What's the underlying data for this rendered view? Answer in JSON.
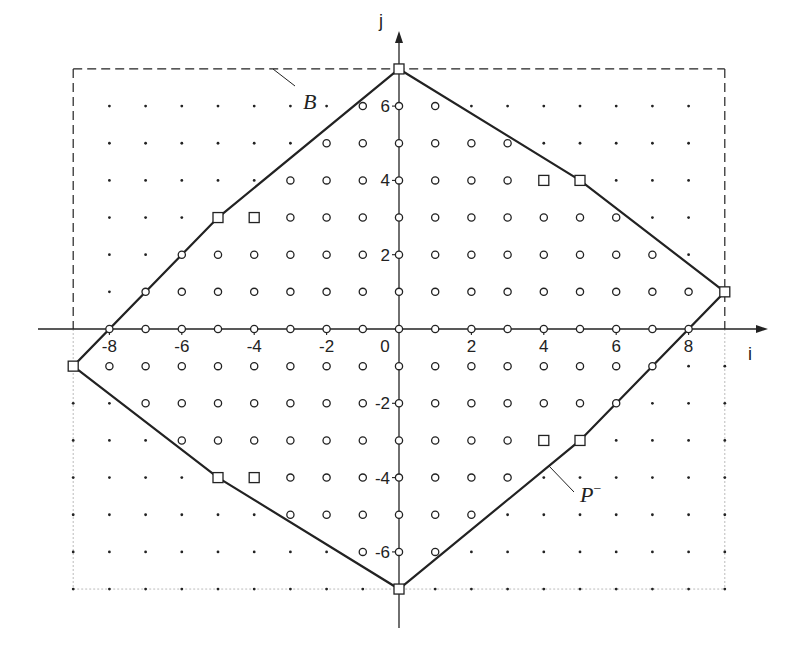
{
  "figure": {
    "axes": {
      "i_label": "i",
      "j_label": "j",
      "i_ticks": [
        -8,
        -6,
        -4,
        -2,
        0,
        2,
        4,
        6,
        8
      ],
      "i_tick_labels": [
        "-8",
        "-6",
        "-4",
        "-2",
        "0",
        "2",
        "4",
        "6",
        "8"
      ],
      "j_ticks": [
        -6,
        -4,
        -2,
        2,
        4,
        6
      ],
      "j_tick_labels": [
        "-6",
        "-4",
        "-2",
        "2",
        "4",
        "6"
      ]
    },
    "labels": {
      "bounding_box": "B",
      "polygon": "P",
      "polygon_superscript": "−"
    },
    "colors": {
      "ink": "#222222",
      "dotted_border": "#bbbbbb",
      "background": "#ffffff"
    }
  },
  "chart_data": {
    "type": "scatter",
    "title": "",
    "xlabel": "i",
    "ylabel": "j",
    "xlim": [
      -9,
      9
    ],
    "ylim": [
      -7,
      7
    ],
    "grid": false,
    "bounding_box_B": {
      "i_min": -9,
      "i_max": 9,
      "j_min": -7,
      "j_max": 7
    },
    "polygon_P_minus_vertices": [
      [
        0,
        7
      ],
      [
        5,
        4
      ],
      [
        9,
        1
      ],
      [
        5,
        -3
      ],
      [
        0,
        -7
      ],
      [
        -5,
        -4
      ],
      [
        -9,
        -1
      ],
      [
        -5,
        3
      ]
    ],
    "square_markers_vertices": [
      [
        0,
        7
      ],
      [
        5,
        4
      ],
      [
        9,
        1
      ],
      [
        5,
        -3
      ],
      [
        0,
        -7
      ],
      [
        -5,
        -4
      ],
      [
        -9,
        -1
      ],
      [
        -5,
        3
      ]
    ],
    "square_markers_interior": [
      [
        -4,
        3
      ],
      [
        4,
        4
      ],
      [
        4,
        -3
      ],
      [
        -4,
        -4
      ]
    ],
    "circle_rows": [
      {
        "j": 6,
        "i_from": -1,
        "i_to": 1
      },
      {
        "j": 5,
        "i_from": -2,
        "i_to": 3
      },
      {
        "j": 4,
        "i_from": -3,
        "i_to": 5
      },
      {
        "j": 3,
        "i_from": -5,
        "i_to": 6
      },
      {
        "j": 2,
        "i_from": -6,
        "i_to": 7
      },
      {
        "j": 1,
        "i_from": -7,
        "i_to": 9
      },
      {
        "j": 0,
        "i_from": -8,
        "i_to": 8
      },
      {
        "j": -1,
        "i_from": -9,
        "i_to": 7
      },
      {
        "j": -2,
        "i_from": -7,
        "i_to": 6
      },
      {
        "j": -3,
        "i_from": -6,
        "i_to": 5
      },
      {
        "j": -4,
        "i_from": -5,
        "i_to": 3
      },
      {
        "j": -5,
        "i_from": -3,
        "i_to": 2
      },
      {
        "j": -6,
        "i_from": -1,
        "i_to": 1
      }
    ],
    "dot_rows": [
      {
        "j": 6,
        "i_from": -8,
        "i_to": 8
      },
      {
        "j": 5,
        "i_from": -8,
        "i_to": 8
      },
      {
        "j": 4,
        "i_from": -8,
        "i_to": 8
      },
      {
        "j": 3,
        "i_from": -8,
        "i_to": 8
      },
      {
        "j": 2,
        "i_from": -8,
        "i_to": 8
      },
      {
        "j": 1,
        "i_from": -8,
        "i_to": 8
      },
      {
        "j": -1,
        "i_from": -9,
        "i_to": 9
      },
      {
        "j": -2,
        "i_from": -9,
        "i_to": 9
      },
      {
        "j": -3,
        "i_from": -9,
        "i_to": 9
      },
      {
        "j": -4,
        "i_from": -9,
        "i_to": 9
      },
      {
        "j": -5,
        "i_from": -9,
        "i_to": 9
      },
      {
        "j": -6,
        "i_from": -9,
        "i_to": 9
      },
      {
        "j": -7,
        "i_from": -9,
        "i_to": 9
      }
    ],
    "annotations": [
      {
        "text": "B",
        "points_to": "bounding box (dashed rectangle)"
      },
      {
        "text": "P⁻",
        "points_to": "polygon boundary"
      }
    ]
  }
}
